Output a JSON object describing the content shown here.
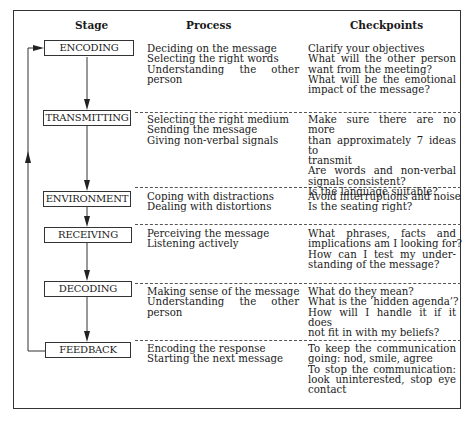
{
  "headers": {
    "stage": "Stage",
    "process": "Process",
    "checkpoints": "Checkpoints"
  },
  "rows": [
    {
      "stage": "ENCODING",
      "process": [
        "Deciding on the message",
        "Selecting the right words",
        "Understanding the other",
        "person"
      ],
      "checkpoints": [
        "Clarify your objectives",
        "What will the other person",
        "want from the meeting?",
        "What will be the emotional",
        "impact of the message?"
      ]
    },
    {
      "stage": "TRANSMITTING",
      "process": [
        "Selecting the right medium",
        "Sending the message",
        "Giving non-verbal signals"
      ],
      "checkpoints": [
        "Make sure there are no more",
        "than approximately 7 ideas to",
        "transmit",
        "Are words and non-verbal",
        "signals consistent?",
        "Is the language suitable?"
      ]
    },
    {
      "stage": "ENVIRONMENT",
      "process": [
        "Coping with distractions",
        "Dealing with distortions"
      ],
      "checkpoints": [
        "Avoid interruptions and noise",
        "Is the seating right?"
      ]
    },
    {
      "stage": "RECEIVING",
      "process": [
        "Perceiving the message",
        "Listening actively"
      ],
      "checkpoints": [
        "What phrases, facts and",
        "implications am I looking for?",
        "How can I test my under-",
        "standing of the message?"
      ]
    },
    {
      "stage": "DECODING",
      "process": [
        "Making sense of the message",
        "Understanding the other",
        "person"
      ],
      "checkpoints": [
        "What do they mean?",
        "What is the ‘hidden agenda’?",
        "How will I handle it if it does",
        "not fit in with my beliefs?"
      ]
    },
    {
      "stage": "FEEDBACK",
      "process": [
        "Encoding the response",
        "Starting the next message"
      ],
      "checkpoints": [
        "To keep the communication",
        "going: nod, smile, agree",
        "To stop the communication:",
        "look uninterested, stop eye",
        "contact"
      ]
    }
  ],
  "colors": {
    "line": "#333333",
    "text": "#1a1a1a",
    "background": "#ffffff"
  }
}
